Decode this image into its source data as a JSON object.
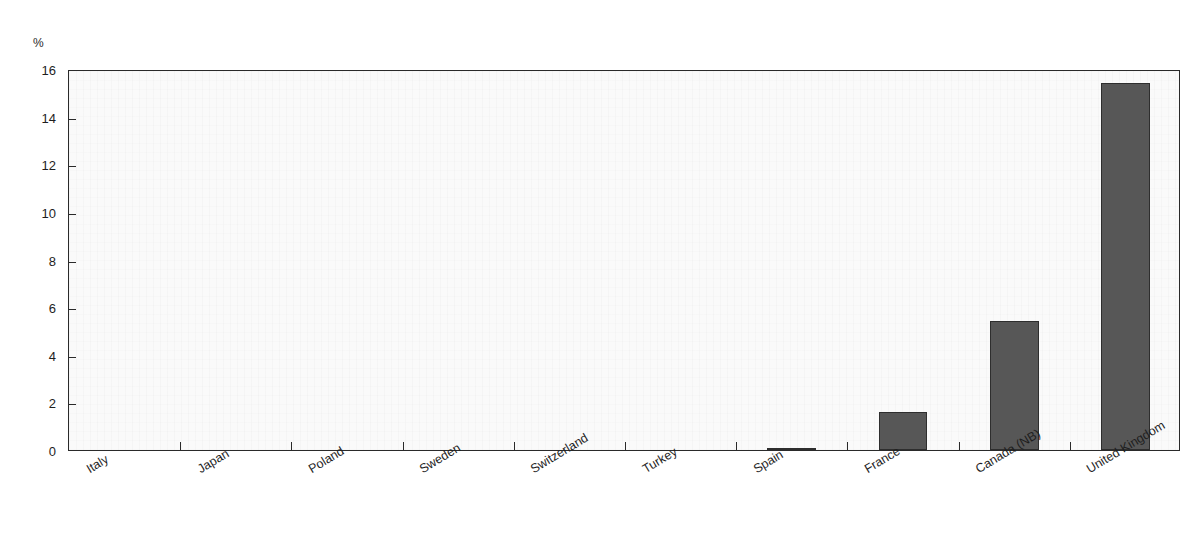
{
  "chart_data": {
    "type": "bar",
    "title": "",
    "xlabel": "",
    "ylabel": "%",
    "ylim": [
      0,
      16
    ],
    "yticks": [
      0,
      2,
      4,
      6,
      8,
      10,
      12,
      14,
      16
    ],
    "grid": false,
    "legend": null,
    "bar_color": "#575757",
    "plot_background": "#fafafa",
    "axis_color": "#2a2a2a",
    "categories": [
      "Italy",
      "Japan",
      "Poland",
      "Sweden",
      "Switzerland",
      "Turkey",
      "Spain",
      "France",
      "Canada (NB)",
      "United Kingdom"
    ],
    "values": [
      0,
      0,
      0,
      0,
      0,
      0,
      0.1,
      1.6,
      5.4,
      15.4
    ]
  }
}
